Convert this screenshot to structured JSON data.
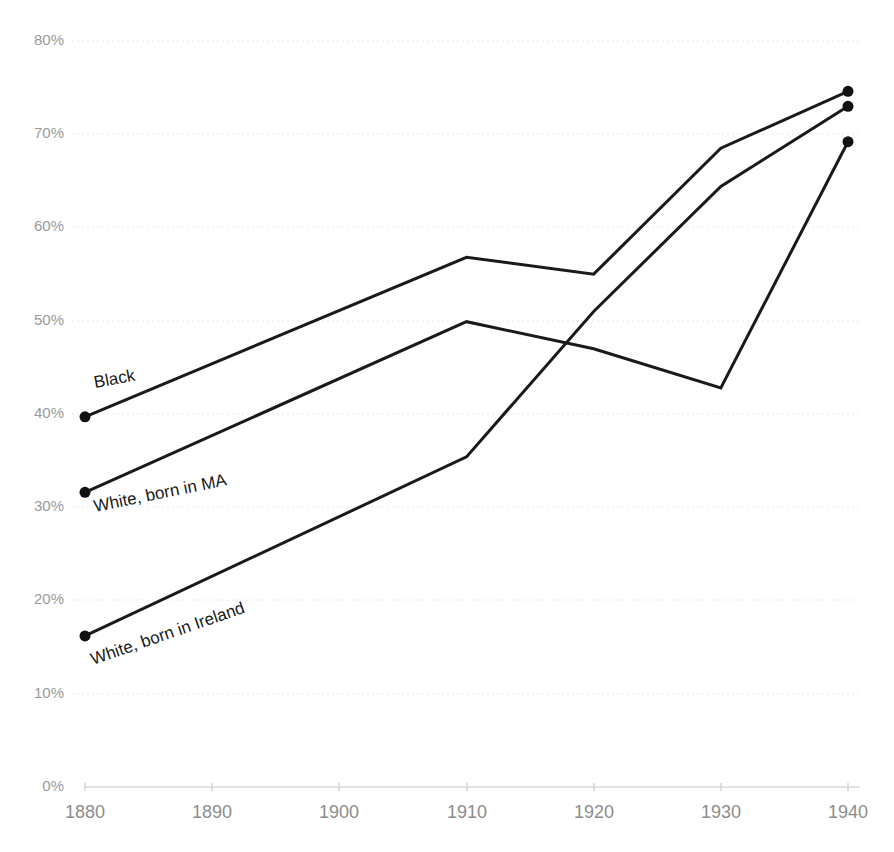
{
  "chart_data": {
    "type": "line",
    "title": "",
    "subtitle": "",
    "xlabel": "",
    "ylabel": "",
    "x": [
      1880,
      1890,
      1900,
      1910,
      1920,
      1930,
      1940
    ],
    "categories": [
      "1880",
      "1890",
      "1900",
      "1910",
      "1920",
      "1930",
      "1940"
    ],
    "xlim": [
      1880,
      1940
    ],
    "ylim": [
      0,
      80
    ],
    "y_tick_labels": [
      "0%",
      "10%",
      "20%",
      "30%",
      "40%",
      "50%",
      "60%",
      "70%",
      "80%"
    ],
    "y_tick_values": [
      0,
      10,
      20,
      30,
      40,
      50,
      60,
      70,
      80
    ],
    "x_tick_labels": [
      "1880",
      "1890",
      "1900",
      "1910",
      "1920",
      "1930",
      "1940"
    ],
    "grid": true,
    "grid_style": "dotted-horizontal",
    "legend": "inline-labels-on-lines",
    "value_unit": "percent",
    "line_color": "#1a1a1a",
    "grid_color": "#e9e9ee",
    "axis_color": "#c8c8d0",
    "tick_label_color": "#8d8d8d",
    "background_color": "#ffffff",
    "series": [
      {
        "name": "Black",
        "label": "Black",
        "color": "#1a1a1a",
        "x": [
          1880,
          1910,
          1920,
          1930,
          1940
        ],
        "values": [
          39.7,
          56.8,
          55.0,
          68.5,
          74.6
        ],
        "endpoint_markers": [
          1880,
          1940
        ]
      },
      {
        "name": "White, born in MA",
        "label": "White, born in MA",
        "color": "#1a1a1a",
        "x": [
          1880,
          1910,
          1920,
          1930,
          1940
        ],
        "values": [
          31.6,
          49.9,
          47.0,
          42.8,
          69.2
        ],
        "endpoint_markers": [
          1880,
          1940
        ]
      },
      {
        "name": "White, born in Ireland",
        "label": "White, born in Ireland",
        "color": "#1a1a1a",
        "x": [
          1880,
          1910,
          1920,
          1930,
          1940
        ],
        "values": [
          16.2,
          35.4,
          51.0,
          64.4,
          73.0
        ],
        "endpoint_markers": [
          1880,
          1940
        ]
      }
    ]
  },
  "labels": {
    "black": "Black",
    "white_ma": "White, born in MA",
    "white_ireland": "White, born in Ireland"
  },
  "yticks": {
    "t0": "0%",
    "t10": "10%",
    "t20": "20%",
    "t30": "30%",
    "t40": "40%",
    "t50": "50%",
    "t60": "60%",
    "t70": "70%",
    "t80": "80%"
  },
  "xticks": {
    "t1880": "1880",
    "t1890": "1890",
    "t1900": "1900",
    "t1910": "1910",
    "t1920": "1920",
    "t1930": "1930",
    "t1940": "1940"
  }
}
